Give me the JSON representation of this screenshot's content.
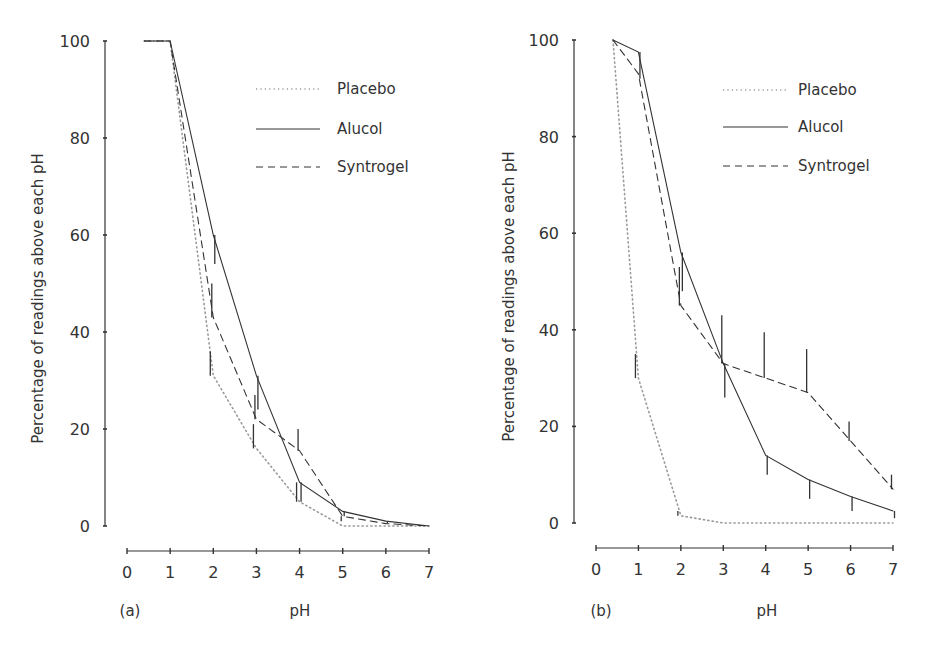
{
  "chart_data": [
    {
      "type": "line",
      "panel_label": "(a)",
      "xlabel": "pH",
      "ylabel": "Percentage of readings above each pH",
      "xlim": [
        0,
        7
      ],
      "ylim": [
        0,
        100
      ],
      "xticks": [
        0,
        1,
        2,
        3,
        4,
        5,
        6,
        7
      ],
      "yticks": [
        0,
        20,
        40,
        60,
        80,
        100
      ],
      "grid": false,
      "legend_position": "upper right",
      "series": [
        {
          "name": "Placebo",
          "style": "dotted",
          "x": [
            0.4,
            1,
            2,
            3,
            4,
            5,
            6,
            7
          ],
          "values": [
            100,
            100,
            31,
            16,
            5,
            0,
            0,
            0
          ],
          "error_bars": [
            null,
            null,
            [
              31,
              36
            ],
            [
              16,
              21
            ],
            [
              5,
              9
            ],
            null,
            null,
            null
          ]
        },
        {
          "name": "Alucol",
          "style": "solid",
          "x": [
            0.4,
            1,
            2,
            3,
            4,
            5,
            6,
            7
          ],
          "values": [
            100,
            100,
            60,
            31,
            9,
            3,
            1,
            0
          ],
          "error_bars": [
            null,
            null,
            [
              54,
              60
            ],
            [
              24,
              31
            ],
            [
              5,
              9
            ],
            [
              2,
              3
            ],
            [
              0.5,
              1
            ],
            null
          ]
        },
        {
          "name": "Syntrogel",
          "style": "dashed",
          "x": [
            0.4,
            1,
            2,
            3,
            4,
            5,
            6,
            7
          ],
          "values": [
            100,
            100,
            43,
            22,
            15.5,
            2,
            0.5,
            0
          ],
          "error_bars": [
            null,
            null,
            [
              43,
              50
            ],
            [
              22,
              27
            ],
            [
              15.5,
              20
            ],
            [
              1,
              2
            ],
            null,
            null
          ]
        }
      ]
    },
    {
      "type": "line",
      "panel_label": "(b)",
      "xlabel": "pH",
      "ylabel": "Percentage of readings above each pH",
      "xlim": [
        0,
        7
      ],
      "ylim": [
        0,
        100
      ],
      "xticks": [
        0,
        1,
        2,
        3,
        4,
        5,
        6,
        7
      ],
      "yticks": [
        0,
        20,
        40,
        60,
        80,
        100
      ],
      "grid": false,
      "legend_position": "upper right",
      "series": [
        {
          "name": "Placebo",
          "style": "dotted",
          "x": [
            0.4,
            1,
            2,
            3,
            4,
            5,
            6,
            7
          ],
          "values": [
            100,
            30,
            1.5,
            0,
            0,
            0,
            0,
            0
          ],
          "error_bars": [
            null,
            [
              30,
              35
            ],
            [
              1.5,
              2.5
            ],
            null,
            null,
            null,
            null,
            null
          ]
        },
        {
          "name": "Alucol",
          "style": "solid",
          "x": [
            0.4,
            1,
            2,
            3,
            4,
            5,
            6,
            7
          ],
          "values": [
            100,
            97.5,
            56,
            33,
            14,
            9,
            5.5,
            2.5
          ],
          "error_bars": [
            null,
            [
              92,
              97.5
            ],
            [
              48,
              56
            ],
            [
              26,
              33
            ],
            [
              10,
              14
            ],
            [
              5,
              9
            ],
            [
              2.5,
              5.5
            ],
            [
              1,
              2.5
            ]
          ]
        },
        {
          "name": "Syntrogel",
          "style": "dashed",
          "x": [
            0.4,
            1,
            2,
            3,
            4,
            5,
            6,
            7
          ],
          "values": [
            100,
            93,
            45,
            33,
            30,
            27,
            17,
            7
          ],
          "error_bars": [
            null,
            null,
            [
              45,
              53
            ],
            [
              33,
              43
            ],
            [
              30,
              39.5
            ],
            [
              27,
              36
            ],
            [
              17,
              21
            ],
            [
              7,
              10
            ]
          ]
        }
      ]
    }
  ],
  "panels": [
    {
      "label": "(a)",
      "xlabel": "pH",
      "ylabel": "Percentage of readings above each pH",
      "yticks": [
        "0",
        "20",
        "40",
        "60",
        "80",
        "100"
      ],
      "xticks": [
        "0",
        "1",
        "2",
        "3",
        "4",
        "5",
        "6",
        "7"
      ],
      "legend": [
        {
          "name": "Placebo",
          "style": "dotted"
        },
        {
          "name": "Alucol",
          "style": "solid"
        },
        {
          "name": "Syntrogel",
          "style": "dashed"
        }
      ]
    },
    {
      "label": "(b)",
      "xlabel": "pH",
      "ylabel": "Percentage of readings above each pH",
      "yticks": [
        "0",
        "20",
        "40",
        "60",
        "80",
        "100"
      ],
      "xticks": [
        "0",
        "1",
        "2",
        "3",
        "4",
        "5",
        "6",
        "7"
      ],
      "legend": [
        {
          "name": "Placebo",
          "style": "dotted"
        },
        {
          "name": "Alucol",
          "style": "solid"
        },
        {
          "name": "Syntrogel",
          "style": "dashed"
        }
      ]
    }
  ],
  "colors": {
    "ink": "#333333",
    "placebo": "#9a9a9a",
    "background": "#ffffff"
  }
}
